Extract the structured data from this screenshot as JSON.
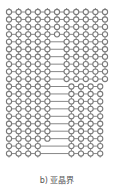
{
  "figure": {
    "caption": "b) 亚晶界",
    "stroke_color": "#7a7a7a",
    "circle_radius": 2.6,
    "origin_x": 9,
    "origin_y": 12,
    "col_spacing": 9.6,
    "row_spacing": 7.45,
    "rows": [
      {
        "left": [
          0,
          1,
          2,
          3,
          4,
          5,
          6,
          7,
          8,
          9,
          10
        ],
        "right": []
      },
      {
        "left": [
          0,
          1,
          2,
          3,
          4,
          5,
          6,
          7,
          8,
          9,
          10
        ],
        "right": []
      },
      {
        "left": [
          0,
          1,
          2,
          3,
          4,
          5,
          6,
          7,
          8,
          9,
          10
        ],
        "right": []
      },
      {
        "left": [
          0,
          1,
          2,
          3,
          4,
          5,
          6,
          7,
          8,
          9,
          10
        ],
        "right": []
      },
      {
        "left": [
          0,
          1,
          2,
          3,
          4
        ],
        "right": [
          6,
          7,
          8,
          9,
          10
        ]
      },
      {
        "left": [
          0,
          1,
          2,
          3,
          4
        ],
        "right": [
          6,
          7,
          8,
          9,
          10
        ]
      },
      {
        "left": [
          0,
          1,
          2,
          3,
          4
        ],
        "right": [
          6,
          7,
          8,
          9,
          10
        ]
      },
      {
        "left": [
          0,
          1,
          2,
          3,
          4
        ],
        "right": [
          6,
          7,
          8,
          9,
          10
        ]
      },
      {
        "left": [
          0,
          1,
          2,
          3,
          4
        ],
        "right": [
          6,
          7,
          8,
          9,
          10
        ]
      },
      {
        "left": [
          0,
          1,
          2,
          3,
          4
        ],
        "right": [
          6,
          7,
          8,
          9,
          10
        ]
      },
      {
        "left": [
          0,
          1,
          2,
          3,
          4
        ],
        "right": [
          6.5,
          7.5,
          8.5,
          9.5
        ]
      },
      {
        "left": [
          0,
          1,
          2,
          3,
          4
        ],
        "right": [
          6.5,
          7.5,
          8.5,
          9.5
        ]
      },
      {
        "left": [
          0,
          1,
          2,
          3,
          4
        ],
        "right": [
          6.5,
          7.5,
          8.5,
          9.5
        ]
      },
      {
        "left": [
          0,
          1,
          2,
          3,
          4
        ],
        "right": [
          6.5,
          7.5,
          8.5,
          9.5
        ]
      },
      {
        "left": [
          0,
          1,
          2,
          3,
          4
        ],
        "right": [
          6.5,
          7.5,
          8.5,
          9.5
        ]
      },
      {
        "left": [
          0,
          1,
          2,
          3,
          4
        ],
        "right": [
          6.5,
          7.5,
          8.5,
          9.5
        ]
      },
      {
        "left": [
          0,
          1,
          2,
          3,
          4
        ],
        "right": [
          6.5,
          7.5,
          8.5,
          9.5
        ]
      },
      {
        "left": [
          0,
          1,
          2,
          3,
          4
        ],
        "right": [
          6.5,
          7.5,
          8.5,
          9.5
        ]
      },
      {
        "left": [
          0,
          1,
          2,
          3
        ],
        "right": [
          6.5,
          7.5,
          8.5,
          9.5
        ]
      },
      {
        "left": [
          0,
          1,
          2,
          3
        ],
        "right": [
          6.5,
          7.5,
          8.5,
          9.5
        ]
      }
    ]
  }
}
